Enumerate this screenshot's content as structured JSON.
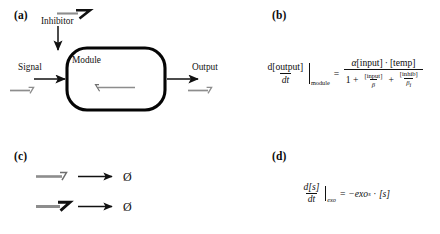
{
  "figure": {
    "panels": {
      "a": {
        "label": "(a)",
        "nodes": {
          "module": "Module",
          "inhibitor": "Inhibitor",
          "signal": "Signal",
          "output": "Output"
        },
        "icons": {
          "inhibitor_strand": "dna-strand-barbed-icon",
          "signal_strand": "dna-strand-hook-icon",
          "output_strand": "dna-strand-hook-icon",
          "module_internal_strand": "dna-strand-reverse-icon",
          "inhibitor_arrow": "arrow-down-icon",
          "signal_arrow": "arrow-right-icon",
          "output_arrow": "arrow-right-icon"
        }
      },
      "b": {
        "label": "(b)",
        "equation": {
          "lhs": {
            "numerator": "d[output]",
            "denominator": "dt",
            "evaluated_at": "module"
          },
          "relation": "=",
          "rhs": {
            "numerator": "α[input] · [temp]",
            "numerator_parts": {
              "alpha": "α",
              "input": "[input]",
              "dot": "·",
              "temp": "[temp]"
            },
            "denominator_parts": {
              "one": "1",
              "plus1": "+",
              "term1_num": "[input]",
              "term1_den": "β",
              "plus2": "+",
              "term2_num": "[inhib]",
              "term2_den_base": "β",
              "term2_den_sub": "i"
            }
          },
          "plain_text": "d[output]/dt |module = α[input]·[temp] / (1 + [input]/β + [inhib]/βi)"
        }
      },
      "c": {
        "label": "(c)",
        "reactions": [
          {
            "reactant_icon": "dna-strand-hook-icon",
            "arrow_icon": "reaction-arrow-right-icon",
            "product": "Ø"
          },
          {
            "reactant_icon": "dna-strand-barbed-icon",
            "arrow_icon": "reaction-arrow-right-icon",
            "product": "Ø"
          }
        ]
      },
      "d": {
        "label": "(d)",
        "equation": {
          "lhs": {
            "numerator": "d[s]",
            "denominator": "dt",
            "evaluated_at": "exo"
          },
          "relation": "=",
          "rhs": {
            "sign": "−",
            "rate": "exo",
            "rate_subscript": "s",
            "dot": "·",
            "species": "[s]"
          },
          "plain_text": "d[s]/dt |exo = −exo_s · [s]"
        }
      }
    },
    "colors": {
      "ink": "#111111",
      "strand_gray": "#8a8a8a",
      "background": "#ffffff"
    }
  }
}
